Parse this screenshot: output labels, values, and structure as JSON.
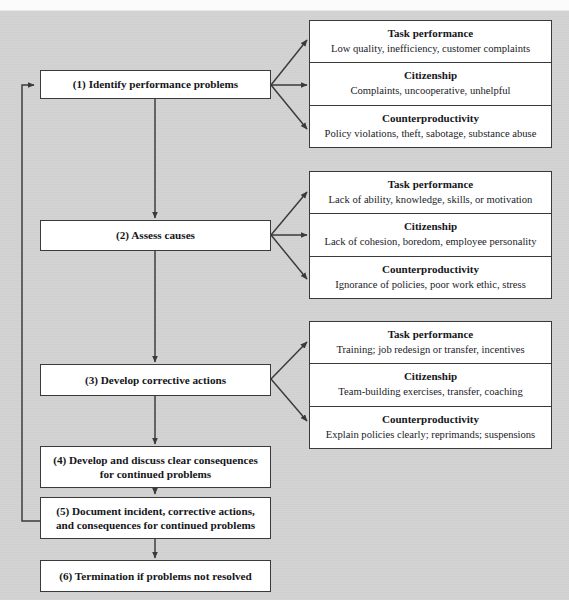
{
  "header": {
    "cropped_caption": ""
  },
  "diagram": {
    "colors": {
      "page_background": "#d2d2d2",
      "box_fill": "#ffffff",
      "box_border": "#3a3a3a",
      "text": "#15161a",
      "arrow": "#3a3a3a"
    },
    "steps": [
      {
        "id": "step-1",
        "label": "(1) Identify performance problems"
      },
      {
        "id": "step-2",
        "label": "(2) Assess causes"
      },
      {
        "id": "step-3",
        "label": "(3) Develop corrective actions"
      },
      {
        "id": "step-4",
        "line1": "(4) Develop and discuss clear consequences",
        "line2": "for continued problems"
      },
      {
        "id": "step-5",
        "line1": "(5) Document incident, corrective actions,",
        "line2": "and consequences for continued problems"
      },
      {
        "id": "step-6",
        "label": "(6) Termination if  problems not resolved"
      }
    ],
    "groups": [
      {
        "id": "group-problems",
        "cells": [
          {
            "title": "Task performance",
            "desc": "Low quality, inefficiency, customer complaints"
          },
          {
            "title": "Citizenship",
            "desc": "Complaints, uncooperative, unhelpful"
          },
          {
            "title": "Counterproductivity",
            "desc": "Policy violations, theft, sabotage, substance abuse"
          }
        ]
      },
      {
        "id": "group-causes",
        "cells": [
          {
            "title": "Task performance",
            "desc": "Lack of ability, knowledge, skills, or motivation"
          },
          {
            "title": "Citizenship",
            "desc": "Lack of cohesion, boredom, employee personality"
          },
          {
            "title": "Counterproductivity",
            "desc": "Ignorance of policies, poor work ethic, stress"
          }
        ]
      },
      {
        "id": "group-actions",
        "cells": [
          {
            "title": "Task performance",
            "desc": "Training; job redesign or transfer, incentives"
          },
          {
            "title": "Citizenship",
            "desc": "Team-building exercises, transfer, coaching"
          },
          {
            "title": "Counterproductivity",
            "desc": "Explain policies clearly; reprimands; suspensions"
          }
        ]
      }
    ]
  }
}
